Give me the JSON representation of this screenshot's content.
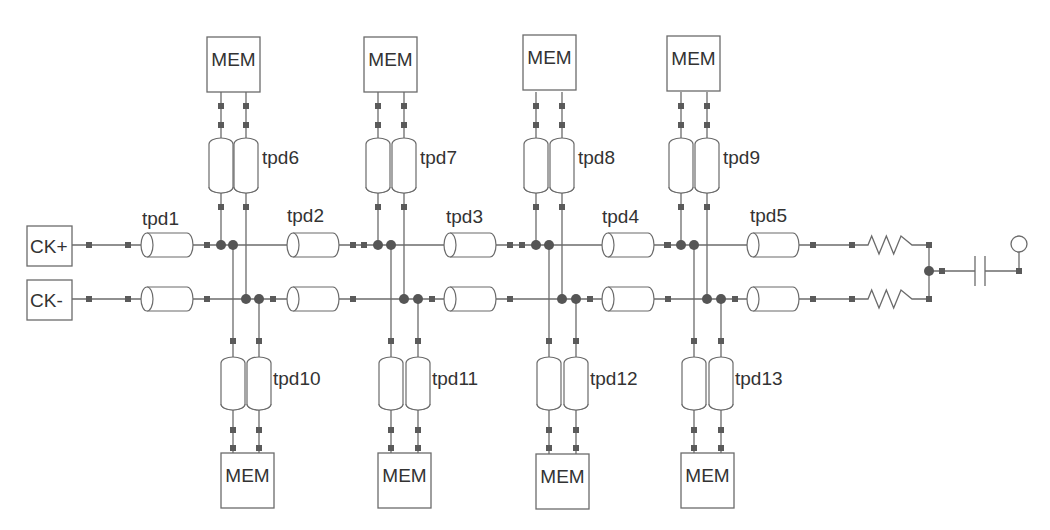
{
  "diagram": {
    "title": "",
    "colors": {
      "wire": "#6b6b6b",
      "text": "#333333",
      "dot": "#555555",
      "background": "#ffffff"
    },
    "rails": {
      "top_y": 245,
      "bottom_y": 299
    },
    "sources": [
      {
        "id": "ck-plus",
        "label": "CK+",
        "x": 27,
        "y": 226,
        "w": 45,
        "h": 40
      },
      {
        "id": "ck-minus",
        "label": "CK-",
        "x": 27,
        "y": 280,
        "w": 45,
        "h": 40
      }
    ],
    "series_lines": [
      {
        "id": "tpd1",
        "label": "tpd1",
        "x": 141,
        "w": 52,
        "label_x": 142,
        "label_y": 225
      },
      {
        "id": "tpd2",
        "label": "tpd2",
        "x": 287,
        "w": 52,
        "label_x": 287,
        "label_y": 222
      },
      {
        "id": "tpd3",
        "label": "tpd3",
        "x": 444,
        "w": 52,
        "label_x": 446,
        "label_y": 223
      },
      {
        "id": "tpd4",
        "label": "tpd4",
        "x": 602,
        "w": 52,
        "label_x": 602,
        "label_y": 223
      },
      {
        "id": "tpd5",
        "label": "tpd5",
        "x": 747,
        "w": 52,
        "label_x": 750,
        "label_y": 222
      }
    ],
    "taps": [
      {
        "col": 1,
        "xs": [
          221,
          233,
          246,
          259
        ],
        "top": {
          "label": "tpd6",
          "mem": "MEM",
          "mem_x": 207,
          "mem_y": 37
        },
        "bottom": {
          "label": "tpd10",
          "mem": "MEM",
          "mem_x": 221,
          "mem_y": 453
        }
      },
      {
        "col": 2,
        "xs": [
          378,
          391,
          404,
          418
        ],
        "top": {
          "label": "tpd7",
          "mem": "MEM",
          "mem_x": 364,
          "mem_y": 37
        },
        "bottom": {
          "label": "tpd11",
          "mem": "MEM",
          "mem_x": 378,
          "mem_y": 453
        }
      },
      {
        "col": 3,
        "xs": [
          536,
          549,
          562,
          576
        ],
        "top": {
          "label": "tpd8",
          "mem": "MEM",
          "mem_x": 523,
          "mem_y": 35
        },
        "bottom": {
          "label": "tpd12",
          "mem": "MEM",
          "mem_x": 536,
          "mem_y": 454
        }
      },
      {
        "col": 4,
        "xs": [
          681,
          694,
          707,
          721
        ],
        "top": {
          "label": "tpd9",
          "mem": "MEM",
          "mem_x": 667,
          "mem_y": 36
        },
        "bottom": {
          "label": "tpd13",
          "mem": "MEM",
          "mem_x": 681,
          "mem_y": 453
        }
      }
    ],
    "termination": {
      "resistors": [
        {
          "id": "r-top",
          "y": 245
        },
        {
          "id": "r-bottom",
          "y": 299
        }
      ],
      "res_x1": 852,
      "res_x2": 929,
      "junction_y": 271,
      "capacitor_x": 980,
      "probe": {
        "x": 1019,
        "circle_y": 244
      }
    }
  }
}
